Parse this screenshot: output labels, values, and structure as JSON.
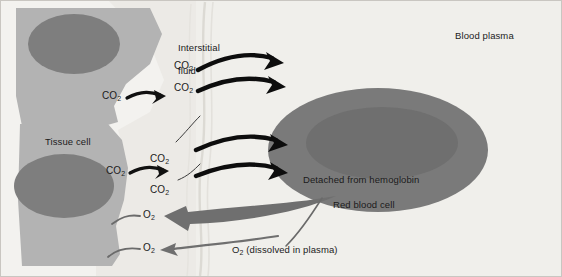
{
  "figure": {
    "background_color": "#f2f1ef",
    "border_color": "#c9c6c1"
  },
  "regions": {
    "tissue_cell": {
      "label": "Tissue cell",
      "cytoplasm_color": "#b2b2b2",
      "nucleus_color": "#7d7d7d"
    },
    "interstitial_fluid": {
      "label": "Interstitial\nfluid",
      "line1": "Interstitial",
      "line2": "fluid",
      "color": "#e9e8e4"
    },
    "blood_plasma": {
      "label": "Blood plasma",
      "color": "#efeeea"
    },
    "red_blood_cell": {
      "label": "Red blood cell",
      "body_color": "#787878",
      "dimple_color": "#6e6e6e"
    }
  },
  "labels": {
    "co2_tissue_upper": "CO",
    "co2_tissue_lower": "CO",
    "co2_fluid_1": "CO",
    "co2_fluid_2": "CO",
    "co2_fluid_3": "CO",
    "co2_fluid_4": "CO",
    "o2_cell_upper": "O",
    "o2_cell_lower": "O",
    "co2_subscript": "2",
    "o2_subscript": "2",
    "detached_from_hemoglobin": "Detached from hemoglobin",
    "o2_dissolved_prefix": "O",
    "o2_dissolved_suffix": " (dissolved in plasma)"
  },
  "arrows": {
    "co2_black_color": "#000000",
    "o2_gray_color": "#6f6f6f",
    "hook_gray_color": "#6b6b6b",
    "leader_gray_color": "#5e5e5e"
  }
}
